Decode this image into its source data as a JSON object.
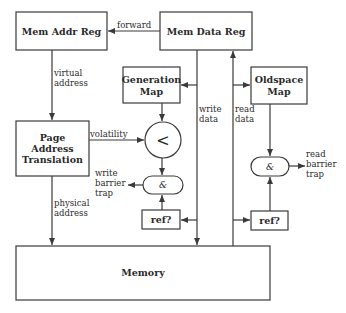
{
  "diagram": {
    "nodes": {
      "mem_addr_reg": "Mem Addr Reg",
      "mem_data_reg": "Mem Data Reg",
      "generation_map": [
        "Generation",
        "Map"
      ],
      "oldspace_map": [
        "Oldspace",
        "Map"
      ],
      "page_address_translation": [
        "Page",
        "Address",
        "Translation"
      ],
      "compare": "<",
      "and_write": "&",
      "and_read": "&",
      "ref_write": "ref?",
      "ref_read": "ref?",
      "memory": "Memory"
    },
    "edges": {
      "forward": "forward",
      "virtual_address": [
        "virtual",
        "address"
      ],
      "physical_address": [
        "physical",
        "address"
      ],
      "volatility": "volatility",
      "write_data": [
        "write",
        "data"
      ],
      "read_data": [
        "read",
        "data"
      ],
      "write_barrier_trap": [
        "write",
        "barrier",
        "trap"
      ],
      "read_barrier_trap": [
        "read",
        "barrier",
        "trap"
      ]
    }
  }
}
